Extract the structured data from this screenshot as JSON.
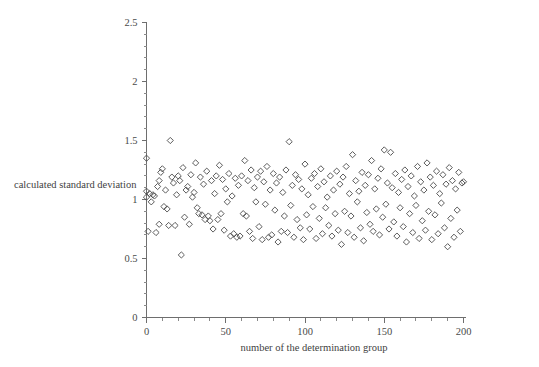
{
  "chart_data": {
    "type": "scatter",
    "title": "",
    "xlabel": "number of the determination group",
    "ylabel": "calculated standard deviation",
    "xlim": [
      0,
      200
    ],
    "ylim": [
      0,
      2.5
    ],
    "xticks": [
      0,
      50,
      100,
      150,
      200
    ],
    "yticks": [
      0,
      0.5,
      1,
      1.5,
      2,
      2.5
    ],
    "xtick_labels": [
      "0",
      "50",
      "100",
      "150",
      "200"
    ],
    "ytick_labels": [
      "0",
      "0.5",
      "1",
      "1.5",
      "2",
      "2.5"
    ],
    "x_minor_tick_step": 10,
    "y_minor_tick_step": 0.1,
    "grid": false,
    "legend": null,
    "marker": "open-diamond",
    "marker_color": "#4a4a4a",
    "series": [
      {
        "name": "calculated standard deviation",
        "points": [
          [
            0,
            1.35
          ],
          [
            0,
            1.07
          ],
          [
            0,
            1.02
          ],
          [
            1,
            0.73
          ],
          [
            2,
            1.05
          ],
          [
            3,
            0.98
          ],
          [
            4,
            1.04
          ],
          [
            5,
            1.03
          ],
          [
            6,
            0.72
          ],
          [
            7,
            1.11
          ],
          [
            8,
            1.16
          ],
          [
            8,
            0.79
          ],
          [
            9,
            1.23
          ],
          [
            10,
            1.26
          ],
          [
            11,
            0.94
          ],
          [
            12,
            1.08
          ],
          [
            13,
            0.92
          ],
          [
            14,
            0.78
          ],
          [
            15,
            1.5
          ],
          [
            16,
            1.19
          ],
          [
            17,
            1.14
          ],
          [
            18,
            0.78
          ],
          [
            19,
            1.04
          ],
          [
            20,
            1.2
          ],
          [
            21,
            1.16
          ],
          [
            22,
            0.53
          ],
          [
            23,
            1.27
          ],
          [
            24,
            0.85
          ],
          [
            25,
            1.08
          ],
          [
            26,
            1.11
          ],
          [
            27,
            0.79
          ],
          [
            28,
            1.21
          ],
          [
            29,
            1.02
          ],
          [
            30,
            1.06
          ],
          [
            31,
            1.31
          ],
          [
            32,
            0.93
          ],
          [
            33,
            0.88
          ],
          [
            34,
            1.19
          ],
          [
            35,
            0.87
          ],
          [
            36,
            1.13
          ],
          [
            37,
            0.83
          ],
          [
            38,
            1.24
          ],
          [
            39,
            0.86
          ],
          [
            40,
            0.82
          ],
          [
            41,
            1.16
          ],
          [
            42,
            0.75
          ],
          [
            43,
            1.05
          ],
          [
            44,
            1.2
          ],
          [
            45,
            0.83
          ],
          [
            46,
            1.29
          ],
          [
            47,
            0.88
          ],
          [
            48,
            1.17
          ],
          [
            49,
            0.74
          ],
          [
            50,
            1.09
          ],
          [
            51,
            0.98
          ],
          [
            52,
            1.22
          ],
          [
            53,
            0.69
          ],
          [
            54,
            1.03
          ],
          [
            55,
            0.71
          ],
          [
            56,
            1.18
          ],
          [
            57,
            0.68
          ],
          [
            58,
            1.12
          ],
          [
            59,
            0.69
          ],
          [
            60,
            1.2
          ],
          [
            61,
            0.88
          ],
          [
            62,
            1.33
          ],
          [
            63,
            0.86
          ],
          [
            64,
            1.16
          ],
          [
            65,
            0.73
          ],
          [
            66,
            1.25
          ],
          [
            67,
            0.67
          ],
          [
            68,
            1.1
          ],
          [
            69,
            0.98
          ],
          [
            70,
            1.19
          ],
          [
            71,
            0.77
          ],
          [
            72,
            1.24
          ],
          [
            73,
            0.66
          ],
          [
            74,
            1.15
          ],
          [
            75,
            0.96
          ],
          [
            76,
            1.28
          ],
          [
            77,
            0.68
          ],
          [
            78,
            1.08
          ],
          [
            79,
            0.7
          ],
          [
            80,
            1.22
          ],
          [
            81,
            0.91
          ],
          [
            82,
            1.14
          ],
          [
            83,
            0.64
          ],
          [
            84,
            1.19
          ],
          [
            85,
            0.73
          ],
          [
            86,
            1.06
          ],
          [
            87,
            0.86
          ],
          [
            88,
            1.25
          ],
          [
            89,
            0.72
          ],
          [
            90,
            1.49
          ],
          [
            91,
            0.95
          ],
          [
            92,
            1.12
          ],
          [
            93,
            0.68
          ],
          [
            94,
            1.21
          ],
          [
            95,
            0.83
          ],
          [
            96,
            1.17
          ],
          [
            97,
            0.76
          ],
          [
            98,
            1.09
          ],
          [
            99,
            0.66
          ],
          [
            100,
            1.3
          ],
          [
            101,
            0.87
          ],
          [
            102,
            1.04
          ],
          [
            103,
            0.75
          ],
          [
            104,
            1.18
          ],
          [
            105,
            0.94
          ],
          [
            106,
            1.22
          ],
          [
            107,
            0.67
          ],
          [
            108,
            1.11
          ],
          [
            109,
            0.84
          ],
          [
            110,
            1.26
          ],
          [
            111,
            0.71
          ],
          [
            112,
            1.15
          ],
          [
            113,
            0.93
          ],
          [
            114,
            1.02
          ],
          [
            115,
            0.78
          ],
          [
            116,
            1.2
          ],
          [
            117,
            0.69
          ],
          [
            118,
            1.08
          ],
          [
            119,
            0.88
          ],
          [
            120,
            1.24
          ],
          [
            121,
            0.74
          ],
          [
            122,
            1.13
          ],
          [
            123,
            0.62
          ],
          [
            124,
            1.19
          ],
          [
            125,
            0.9
          ],
          [
            126,
            1.28
          ],
          [
            127,
            0.72
          ],
          [
            128,
            1.05
          ],
          [
            129,
            0.86
          ],
          [
            130,
            1.38
          ],
          [
            131,
            0.68
          ],
          [
            132,
            1.16
          ],
          [
            133,
            0.98
          ],
          [
            134,
            1.07
          ],
          [
            135,
            0.76
          ],
          [
            136,
            1.23
          ],
          [
            137,
            0.65
          ],
          [
            138,
            1.12
          ],
          [
            139,
            0.89
          ],
          [
            140,
            1.21
          ],
          [
            141,
            0.79
          ],
          [
            142,
            1.33
          ],
          [
            143,
            0.73
          ],
          [
            144,
            1.09
          ],
          [
            145,
            0.92
          ],
          [
            146,
            1.18
          ],
          [
            147,
            0.7
          ],
          [
            148,
            1.26
          ],
          [
            149,
            0.85
          ],
          [
            150,
            1.42
          ],
          [
            151,
            0.96
          ],
          [
            152,
            1.14
          ],
          [
            153,
            0.75
          ],
          [
            154,
            1.4
          ],
          [
            155,
            1.1
          ],
          [
            156,
            0.81
          ],
          [
            157,
            1.22
          ],
          [
            158,
            0.69
          ],
          [
            159,
            1.06
          ],
          [
            160,
            0.93
          ],
          [
            161,
            1.17
          ],
          [
            162,
            0.77
          ],
          [
            163,
            1.25
          ],
          [
            164,
            0.64
          ],
          [
            165,
            1.11
          ],
          [
            166,
            0.88
          ],
          [
            167,
            1.2
          ],
          [
            168,
            0.72
          ],
          [
            169,
            1.03
          ],
          [
            170,
            0.95
          ],
          [
            171,
            1.28
          ],
          [
            172,
            0.67
          ],
          [
            173,
            1.15
          ],
          [
            174,
            0.82
          ],
          [
            175,
            1.08
          ],
          [
            176,
            0.74
          ],
          [
            177,
            1.31
          ],
          [
            178,
            0.9
          ],
          [
            179,
            1.19
          ],
          [
            180,
            0.66
          ],
          [
            181,
            1.12
          ],
          [
            182,
            0.87
          ],
          [
            183,
            1.24
          ],
          [
            184,
            0.71
          ],
          [
            185,
            1.05
          ],
          [
            186,
            0.97
          ],
          [
            187,
            1.21
          ],
          [
            188,
            0.76
          ],
          [
            189,
            1.13
          ],
          [
            190,
            0.6
          ],
          [
            191,
            1.27
          ],
          [
            192,
            0.84
          ],
          [
            193,
            1.16
          ],
          [
            194,
            0.68
          ],
          [
            195,
            1.09
          ],
          [
            196,
            0.91
          ],
          [
            197,
            1.23
          ],
          [
            198,
            0.73
          ],
          [
            199,
            1.14
          ],
          [
            200,
            1.15
          ]
        ]
      }
    ]
  }
}
